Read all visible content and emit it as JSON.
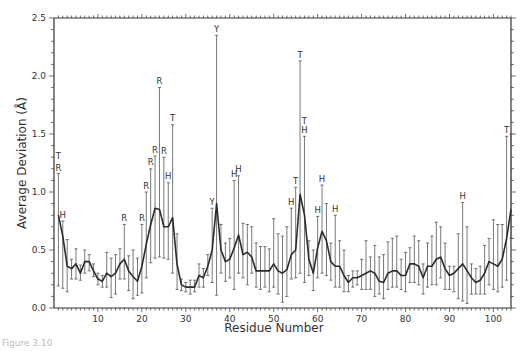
{
  "chart_data": {
    "type": "line",
    "title": "",
    "xlabel": "Residue Number",
    "ylabel": "Average Deviation (Å)",
    "xlim": [
      0,
      104
    ],
    "ylim": [
      0.0,
      2.5
    ],
    "x_ticks": [
      10,
      20,
      30,
      40,
      50,
      60,
      70,
      80,
      90,
      100
    ],
    "y_ticks": [
      "0.0",
      "0.5",
      "1.0",
      "1.5",
      "2.0",
      "2.5"
    ],
    "grid": false,
    "legend": null,
    "series": [
      {
        "name": "Average Deviation",
        "style": "line with vertical error bars",
        "x": [
          1,
          2,
          3,
          4,
          5,
          6,
          7,
          8,
          9,
          10,
          11,
          12,
          13,
          14,
          15,
          16,
          17,
          18,
          19,
          20,
          21,
          22,
          23,
          24,
          25,
          26,
          27,
          28,
          29,
          30,
          31,
          32,
          33,
          34,
          35,
          36,
          37,
          38,
          39,
          40,
          41,
          42,
          43,
          44,
          45,
          46,
          47,
          48,
          49,
          50,
          51,
          52,
          53,
          54,
          55,
          56,
          57,
          58,
          59,
          60,
          61,
          62,
          63,
          64,
          65,
          66,
          67,
          68,
          69,
          70,
          71,
          72,
          73,
          74,
          75,
          76,
          77,
          78,
          79,
          80,
          81,
          82,
          83,
          84,
          85,
          86,
          87,
          88,
          89,
          90,
          91,
          92,
          93,
          94,
          95,
          96,
          97,
          98,
          99,
          100,
          101,
          102,
          103,
          104
        ],
        "mean": [
          0.8,
          0.62,
          0.36,
          0.34,
          0.38,
          0.3,
          0.4,
          0.4,
          0.32,
          0.25,
          0.23,
          0.3,
          0.27,
          0.3,
          0.38,
          0.42,
          0.32,
          0.27,
          0.23,
          0.36,
          0.55,
          0.72,
          0.86,
          0.85,
          0.7,
          0.7,
          0.78,
          0.38,
          0.2,
          0.18,
          0.18,
          0.18,
          0.28,
          0.26,
          0.36,
          0.5,
          0.9,
          0.5,
          0.4,
          0.42,
          0.52,
          0.63,
          0.46,
          0.48,
          0.44,
          0.32,
          0.32,
          0.32,
          0.32,
          0.38,
          0.32,
          0.3,
          0.33,
          0.46,
          0.5,
          0.98,
          0.8,
          0.42,
          0.3,
          0.52,
          0.66,
          0.58,
          0.4,
          0.36,
          0.36,
          0.28,
          0.22,
          0.26,
          0.26,
          0.28,
          0.3,
          0.32,
          0.3,
          0.23,
          0.22,
          0.3,
          0.32,
          0.32,
          0.28,
          0.28,
          0.38,
          0.38,
          0.36,
          0.26,
          0.36,
          0.36,
          0.42,
          0.44,
          0.34,
          0.28,
          0.3,
          0.34,
          0.38,
          0.32,
          0.26,
          0.22,
          0.24,
          0.3,
          0.4,
          0.38,
          0.36,
          0.42,
          0.6,
          0.85
        ],
        "upper": [
          1.16,
          0.75,
          0.59,
          0.42,
          0.51,
          0.37,
          0.5,
          0.46,
          0.38,
          0.3,
          0.28,
          0.48,
          0.43,
          0.46,
          0.51,
          0.72,
          0.45,
          0.5,
          0.43,
          0.72,
          1.0,
          1.2,
          1.31,
          1.9,
          1.3,
          1.08,
          1.58,
          0.64,
          0.25,
          0.22,
          0.24,
          0.24,
          0.38,
          0.34,
          0.46,
          0.86,
          2.35,
          0.72,
          0.56,
          0.6,
          1.1,
          1.14,
          0.73,
          0.72,
          0.7,
          0.56,
          0.53,
          0.53,
          0.51,
          0.77,
          0.64,
          0.62,
          0.7,
          0.86,
          1.04,
          2.13,
          1.48,
          0.58,
          0.5,
          0.79,
          1.06,
          0.9,
          0.56,
          0.8,
          0.58,
          0.5,
          0.28,
          0.32,
          0.32,
          0.42,
          0.58,
          0.44,
          0.54,
          0.44,
          0.46,
          0.57,
          0.6,
          0.62,
          0.42,
          0.48,
          0.52,
          0.62,
          0.58,
          0.38,
          0.56,
          0.62,
          0.74,
          0.7,
          0.56,
          0.36,
          0.36,
          0.64,
          0.91,
          0.7,
          0.38,
          0.34,
          0.36,
          0.54,
          0.6,
          0.76,
          0.72,
          0.72,
          1.48,
          1.5
        ],
        "lower": [
          0.19,
          0.17,
          0.14,
          0.25,
          0.25,
          0.24,
          0.3,
          0.32,
          0.27,
          0.2,
          0.18,
          0.18,
          0.09,
          0.12,
          0.25,
          0.25,
          0.15,
          0.08,
          0.11,
          0.13,
          0.26,
          0.39,
          0.43,
          0.44,
          0.43,
          0.42,
          0.3,
          0.16,
          0.15,
          0.14,
          0.12,
          0.14,
          0.18,
          0.18,
          0.28,
          0.22,
          0.11,
          0.3,
          0.23,
          0.26,
          0.16,
          0.3,
          0.26,
          0.2,
          0.3,
          0.18,
          0.16,
          0.18,
          0.14,
          0.18,
          0.12,
          0.05,
          0.1,
          0.25,
          0.26,
          0.3,
          0.22,
          0.28,
          0.15,
          0.26,
          0.3,
          0.28,
          0.24,
          0.18,
          0.18,
          0.14,
          0.14,
          0.18,
          0.2,
          0.16,
          0.16,
          0.16,
          0.1,
          0.12,
          0.08,
          0.16,
          0.18,
          0.18,
          0.16,
          0.14,
          0.22,
          0.22,
          0.2,
          0.12,
          0.18,
          0.2,
          0.2,
          0.26,
          0.16,
          0.16,
          0.14,
          0.08,
          0.06,
          0.04,
          0.12,
          0.12,
          0.12,
          0.12,
          0.2,
          0.16,
          0.14,
          0.18,
          0.24,
          0.6
        ]
      }
    ],
    "annotations": [
      {
        "x": 1,
        "y": 1.28,
        "text": "T"
      },
      {
        "x": 1,
        "y": 1.17,
        "text": "R"
      },
      {
        "x": 2,
        "y": 0.77,
        "text": "H"
      },
      {
        "x": 16,
        "y": 0.74,
        "text": "R"
      },
      {
        "x": 20,
        "y": 0.74,
        "text": "R"
      },
      {
        "x": 21,
        "y": 1.02,
        "text": "R"
      },
      {
        "x": 22,
        "y": 1.22,
        "text": "R"
      },
      {
        "x": 23,
        "y": 1.33,
        "text": "R"
      },
      {
        "x": 24,
        "y": 1.92,
        "text": "R"
      },
      {
        "x": 25,
        "y": 1.32,
        "text": "R"
      },
      {
        "x": 26,
        "y": 1.1,
        "text": "H"
      },
      {
        "x": 27,
        "y": 1.6,
        "text": "T"
      },
      {
        "x": 36,
        "y": 0.88,
        "text": "Y"
      },
      {
        "x": 37,
        "y": 2.37,
        "text": "Y"
      },
      {
        "x": 41,
        "y": 1.12,
        "text": "H"
      },
      {
        "x": 42,
        "y": 1.16,
        "text": "H"
      },
      {
        "x": 54,
        "y": 0.88,
        "text": "H"
      },
      {
        "x": 55,
        "y": 1.06,
        "text": "T"
      },
      {
        "x": 56,
        "y": 2.15,
        "text": "T"
      },
      {
        "x": 57,
        "y": 1.58,
        "text": "T"
      },
      {
        "x": 57,
        "y": 1.5,
        "text": "H"
      },
      {
        "x": 60,
        "y": 0.81,
        "text": "H"
      },
      {
        "x": 61,
        "y": 1.08,
        "text": "H"
      },
      {
        "x": 64,
        "y": 0.82,
        "text": "H"
      },
      {
        "x": 93,
        "y": 0.93,
        "text": "H"
      },
      {
        "x": 103,
        "y": 1.5,
        "text": "T"
      }
    ]
  },
  "figure": {
    "caption": "Figure 3.10",
    "colors": {
      "line": "#2b2b2b",
      "errorbar": "#555555",
      "axis": "#333333",
      "background": "#ffffff"
    }
  }
}
